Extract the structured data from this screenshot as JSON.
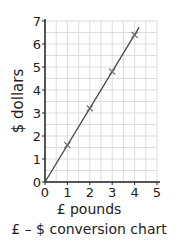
{
  "chart_data": {
    "type": "line",
    "title": "£ – $ conversion chart",
    "xlabel": "£ pounds",
    "ylabel": "$ dollars",
    "x": [
      0,
      1,
      2,
      3,
      4
    ],
    "series": [
      {
        "name": "conversion",
        "values": [
          0,
          1.6,
          3.2,
          4.8,
          6.4
        ]
      }
    ],
    "marked_points": [
      [
        1,
        1.6
      ],
      [
        2,
        3.2
      ],
      [
        3,
        4.8
      ],
      [
        4,
        6.4
      ]
    ],
    "xlim": [
      0,
      5
    ],
    "ylim": [
      0,
      7
    ],
    "x_ticks": [
      "0",
      "1",
      "2",
      "3",
      "4",
      "5"
    ],
    "y_ticks": [
      "0",
      "1",
      "2",
      "3",
      "4",
      "5",
      "6",
      "7"
    ],
    "grid": true,
    "line_color": "#444444",
    "grid_color": "#dddddd"
  }
}
